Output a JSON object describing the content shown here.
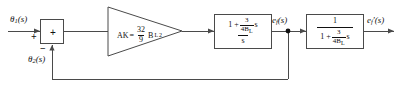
{
  "diagram": {
    "type": "control-system-block-diagram",
    "background_color": "#ffffff",
    "line_color": "#4a4a4a",
    "text_color": "#111111"
  },
  "signals": {
    "input": {
      "base": "θ",
      "subscript": "1",
      "arg": "(s)",
      "full": "θ1(s)"
    },
    "feedback": {
      "base": "θ",
      "subscript": "2",
      "arg": "(s)",
      "full": "θ2(s)"
    },
    "intermediate": {
      "base": "e",
      "subscript": "f",
      "arg": "(s)",
      "full": "ef(s)"
    },
    "output": {
      "base": "e",
      "subscript": "f",
      "prime": "'",
      "arg": "(s)",
      "full": "ef'(s)"
    }
  },
  "summing_junction": {
    "name": "summing-junction",
    "interior_symbol": "+",
    "input_sign": "+",
    "feedback_sign": "−"
  },
  "amplifier": {
    "name": "amplifier-gain-triangle",
    "gain_label": "AK",
    "equals": "=",
    "coefficient": {
      "numerator": "32",
      "denominator": "9"
    },
    "variable": "B",
    "variable_subscript": "L",
    "exponent": "2",
    "full_expression": "AK = (32/9) B_L²"
  },
  "blocks": [
    {
      "name": "loop-filter-block",
      "numerator_prefix": "1 +",
      "numerator_fraction": {
        "num": "3",
        "den": "4B",
        "den_subscript": "L"
      },
      "numerator_suffix": "s",
      "denominator": "s",
      "full_expression": "(1 + (3/4B_L)s) / s"
    },
    {
      "name": "lag-block",
      "numerator": "1",
      "denominator_prefix": "1 +",
      "denominator_fraction": {
        "num": "3",
        "den": "4B",
        "den_subscript": "L"
      },
      "denominator_suffix": "s",
      "full_expression": "1 / (1 + (3/4B_L)s)"
    }
  ],
  "nodes": [
    {
      "name": "feedback-tap-node",
      "label": "ef(s)"
    }
  ]
}
